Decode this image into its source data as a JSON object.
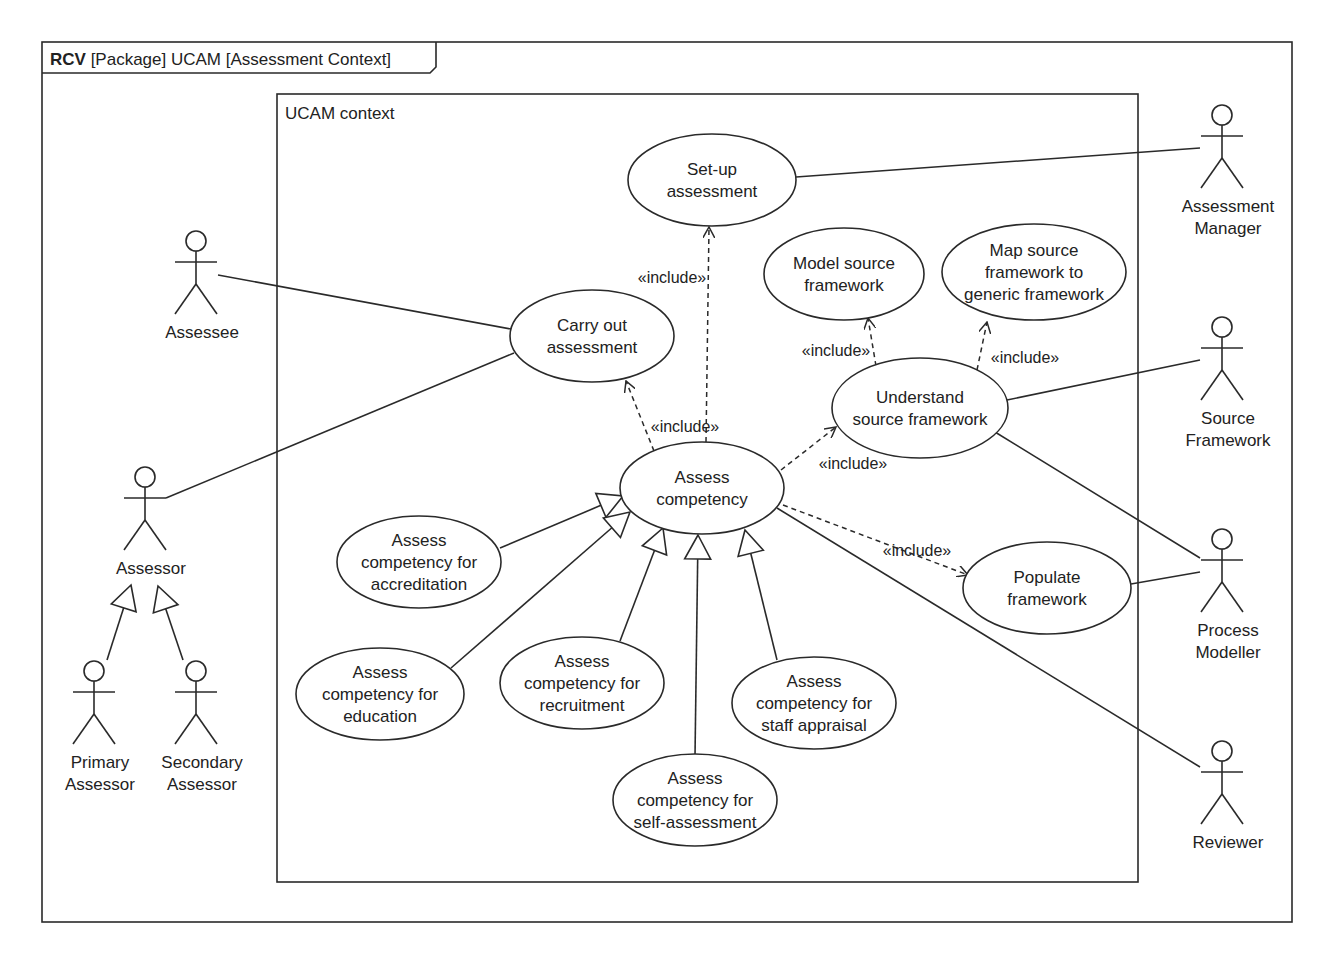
{
  "frame": {
    "title_bold": "RCV",
    "title_rest": " [Package] UCAM [Assessment Context]",
    "x": 42,
    "y": 42,
    "w": 1250,
    "h": 880
  },
  "system": {
    "label": "UCAM context",
    "x": 277,
    "y": 94,
    "w": 861,
    "h": 788
  },
  "colors": {
    "line": "#2a2a2a",
    "text": "#222222",
    "background": "#ffffff"
  },
  "use_cases": [
    {
      "id": "setup",
      "lines": [
        "Set-up",
        "assessment"
      ],
      "cx": 712,
      "cy": 180,
      "rx": 84,
      "ry": 46
    },
    {
      "id": "carryout",
      "lines": [
        "Carry out",
        "assessment"
      ],
      "cx": 592,
      "cy": 336,
      "rx": 82,
      "ry": 46
    },
    {
      "id": "model",
      "lines": [
        "Model source",
        "framework"
      ],
      "cx": 844,
      "cy": 274,
      "rx": 80,
      "ry": 46
    },
    {
      "id": "map",
      "lines": [
        "Map source",
        "framework to",
        "generic framework"
      ],
      "cx": 1034,
      "cy": 272,
      "rx": 92,
      "ry": 48
    },
    {
      "id": "understand",
      "lines": [
        "Understand",
        "source framework"
      ],
      "cx": 920,
      "cy": 408,
      "rx": 88,
      "ry": 50
    },
    {
      "id": "assess",
      "lines": [
        "Assess",
        "competency"
      ],
      "cx": 702,
      "cy": 488,
      "rx": 82,
      "ry": 46
    },
    {
      "id": "populate",
      "lines": [
        "Populate",
        "framework"
      ],
      "cx": 1047,
      "cy": 588,
      "rx": 84,
      "ry": 46
    },
    {
      "id": "accred",
      "lines": [
        "Assess",
        "competency for",
        "accreditation"
      ],
      "cx": 419,
      "cy": 562,
      "rx": 82,
      "ry": 46
    },
    {
      "id": "edu",
      "lines": [
        "Assess",
        "competency for",
        "education"
      ],
      "cx": 380,
      "cy": 694,
      "rx": 84,
      "ry": 46
    },
    {
      "id": "recruit",
      "lines": [
        "Assess",
        "competency for",
        "recruitment"
      ],
      "cx": 582,
      "cy": 683,
      "rx": 82,
      "ry": 46
    },
    {
      "id": "staff",
      "lines": [
        "Assess",
        "competency for",
        "staff appraisal"
      ],
      "cx": 814,
      "cy": 703,
      "rx": 82,
      "ry": 46
    },
    {
      "id": "self",
      "lines": [
        "Assess",
        "competency for",
        "self-assessment"
      ],
      "cx": 695,
      "cy": 800,
      "rx": 82,
      "ry": 46
    }
  ],
  "actors": [
    {
      "id": "assessee",
      "lines": [
        "Assessee"
      ],
      "x": 196,
      "y": 230
    },
    {
      "id": "assessor",
      "lines": [
        "Assessor"
      ],
      "x": 145,
      "y": 466
    },
    {
      "id": "primary",
      "lines": [
        "Primary",
        "Assessor"
      ],
      "x": 94,
      "y": 660
    },
    {
      "id": "secondary",
      "lines": [
        "Secondary",
        "Assessor"
      ],
      "x": 196,
      "y": 660
    },
    {
      "id": "manager",
      "lines": [
        "Assessment",
        "Manager"
      ],
      "x": 1222,
      "y": 104
    },
    {
      "id": "source",
      "lines": [
        "Source",
        "Framework"
      ],
      "x": 1222,
      "y": 316
    },
    {
      "id": "modeller",
      "lines": [
        "Process",
        "Modeller"
      ],
      "x": 1222,
      "y": 528
    },
    {
      "id": "reviewer",
      "lines": [
        "Reviewer"
      ],
      "x": 1222,
      "y": 740
    }
  ],
  "associations": [
    {
      "from": "assessee",
      "to": "carryout",
      "x1": 218,
      "y1": 275,
      "x2": 511,
      "y2": 329
    },
    {
      "from": "assessor",
      "to": "carryout",
      "x1": 166,
      "y1": 498,
      "x2": 514,
      "y2": 353
    },
    {
      "from": "manager",
      "to": "setup",
      "x1": 1200,
      "y1": 148,
      "x2": 796,
      "y2": 177
    },
    {
      "from": "source",
      "to": "understand",
      "x1": 1200,
      "y1": 360,
      "x2": 1007,
      "y2": 400
    },
    {
      "from": "modeller",
      "to": "understand",
      "x1": 1200,
      "y1": 558,
      "x2": 995,
      "y2": 432
    },
    {
      "from": "modeller",
      "to": "populate",
      "x1": 1200,
      "y1": 572,
      "x2": 1131,
      "y2": 584
    },
    {
      "from": "reviewer",
      "to": "assess",
      "x1": 1200,
      "y1": 767,
      "x2": 777,
      "y2": 508
    }
  ],
  "includes": [
    {
      "label": "«include»",
      "from": "assess",
      "to": "setup",
      "x1": 706,
      "y1": 442,
      "x2": 709,
      "y2": 227,
      "lx": 672,
      "ly": 283
    },
    {
      "label": "«include»",
      "from": "assess",
      "to": "carryout",
      "x1": 654,
      "y1": 451,
      "x2": 626,
      "y2": 381,
      "lx": 685,
      "ly": 432
    },
    {
      "label": "«include»",
      "from": "understand",
      "to": "model",
      "x1": 876,
      "y1": 366,
      "x2": 868,
      "y2": 318,
      "lx": 836,
      "ly": 356
    },
    {
      "from": "understand",
      "to": "map",
      "label": "«include»",
      "x1": 977,
      "y1": 370,
      "x2": 987,
      "y2": 322,
      "lx": 1025,
      "ly": 363
    },
    {
      "label": "«include»",
      "from": "assess",
      "to": "understand",
      "x1": 781,
      "y1": 470,
      "x2": 836,
      "y2": 427,
      "lx": 853,
      "ly": 469
    },
    {
      "label": "«include»",
      "from": "assess",
      "to": "populate",
      "x1": 783,
      "y1": 505,
      "x2": 968,
      "y2": 575,
      "lx": 917,
      "ly": 556
    }
  ],
  "generalizations": [
    {
      "from": "accred",
      "to": "assess",
      "x1": 500,
      "y1": 548,
      "x2": 623,
      "y2": 496
    },
    {
      "from": "edu",
      "to": "assess",
      "x1": 451,
      "y1": 668,
      "x2": 630,
      "y2": 512
    },
    {
      "from": "recruit",
      "to": "assess",
      "x1": 620,
      "y1": 641,
      "x2": 663,
      "y2": 528
    },
    {
      "from": "self",
      "to": "assess",
      "x1": 695,
      "y1": 757,
      "x2": 698,
      "y2": 535
    },
    {
      "from": "staff",
      "to": "assess",
      "x1": 777,
      "y1": 660,
      "x2": 745,
      "y2": 530
    },
    {
      "from": "primary",
      "to": "assessor",
      "x1": 107,
      "y1": 660,
      "x2": 131,
      "y2": 585
    },
    {
      "from": "secondary",
      "to": "assessor",
      "x1": 183,
      "y1": 660,
      "x2": 158,
      "y2": 586
    }
  ]
}
